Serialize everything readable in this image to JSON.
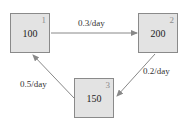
{
  "nodes": [
    {
      "index": "1",
      "value": "100"
    },
    {
      "index": "2",
      "value": "200"
    },
    {
      "index": "3",
      "value": "150"
    }
  ],
  "edges": [
    {
      "from": "1",
      "to": "2",
      "label": "0.3/day"
    },
    {
      "from": "2",
      "to": "3",
      "label": "0.2/day"
    },
    {
      "from": "3",
      "to": "1",
      "label": "0.5/day"
    }
  ],
  "colors": {
    "box_fill": "#e3e3e3",
    "box_border": "#8a8a8a",
    "arrow": "#888888"
  }
}
